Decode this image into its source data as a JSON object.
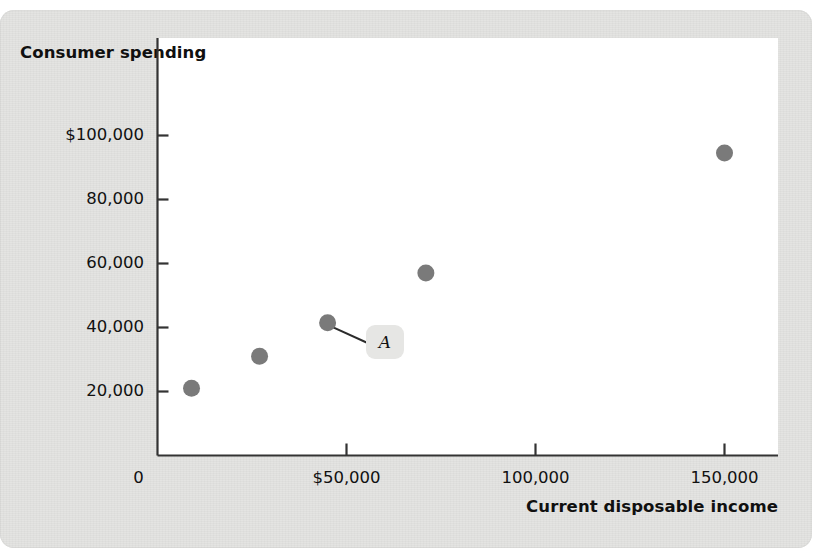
{
  "chart_data": {
    "type": "scatter",
    "title": "",
    "xlabel": "Current disposable income",
    "ylabel": "Consumer spending",
    "xlim": [
      0,
      166000
    ],
    "ylim": [
      0,
      110000
    ],
    "grid": false,
    "legend": "none",
    "x_ticks": [
      {
        "value": 0,
        "label": "0"
      },
      {
        "value": 50000,
        "label": "$50,000"
      },
      {
        "value": 100000,
        "label": "100,000"
      },
      {
        "value": 150000,
        "label": "150,000"
      }
    ],
    "y_ticks": [
      {
        "value": 100000,
        "label": "$100,000"
      },
      {
        "value": 80000,
        "label": "80,000"
      },
      {
        "value": 60000,
        "label": "60,000"
      },
      {
        "value": 40000,
        "label": "40,000"
      },
      {
        "value": 20000,
        "label": "20,000"
      }
    ],
    "x": [
      9000,
      27000,
      45000,
      71000,
      150000
    ],
    "y": [
      21000,
      31000,
      41500,
      57000,
      94500
    ],
    "point_color": "#7a7a7a",
    "annotations": [
      {
        "label": "A",
        "point_index": 2,
        "point_x": 45000,
        "point_y": 41500
      }
    ]
  },
  "figure": {
    "panel_color": "#e3e3e1",
    "plot_background": "#ffffff",
    "axis_color": "#333333"
  }
}
